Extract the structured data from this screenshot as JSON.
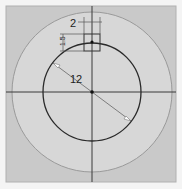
{
  "colors": {
    "frame_bg": "#f4f4f4",
    "sketch_bg": "#c9c9c9",
    "outer_circle_fill": "#d7d7d7",
    "line": "#3a3a3a",
    "dim_line": "#555555",
    "dim_arrow": "#ffffff"
  },
  "dimensions": {
    "width_label": "2",
    "height_label": "1.5",
    "diameter_label": "12"
  }
}
